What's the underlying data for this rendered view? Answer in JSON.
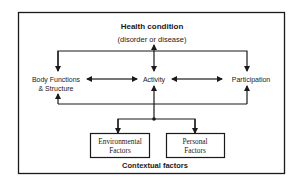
{
  "diagram": {
    "title": "Health condition",
    "subtitle": "(disorder or disease)",
    "nodes": {
      "body_functions": {
        "line1": "Body Functions",
        "line2": "& Structure"
      },
      "activity": {
        "label": "Activity"
      },
      "participation": {
        "label": "Participation"
      },
      "environmental": {
        "line1": "Environmental",
        "line2": "Factors"
      },
      "personal": {
        "line1": "Personal",
        "line2": "Factors"
      }
    },
    "footer": "Contextual factors",
    "colors": {
      "line": "#1a1a1a",
      "text": "#1a1a1a",
      "background": "#ffffff"
    }
  }
}
